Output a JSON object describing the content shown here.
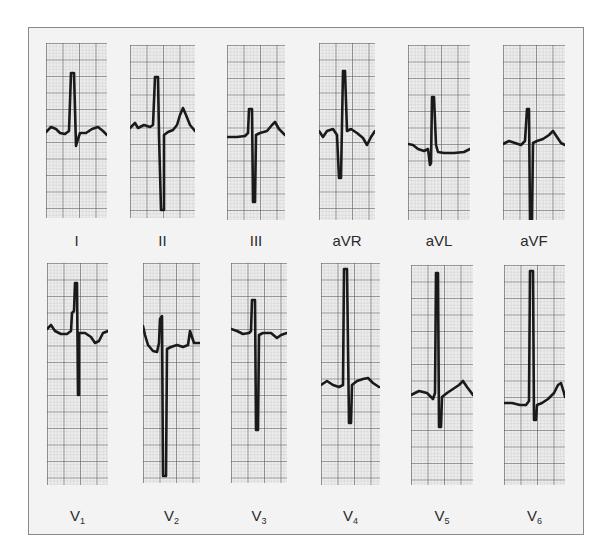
{
  "figure": {
    "type": "12-lead ECG",
    "rows": [
      {
        "name": "limb-leads",
        "leads": [
          {
            "id": "I",
            "label": "I",
            "sub": "",
            "box": [
              46,
              43,
              61,
              175
            ],
            "trace": "0,89 5,84 10,86 14,90 19,91 23,88 25,30 28,30 30,103 32,96 34,90 40,90 46,86 52,84 57,88 61,92"
          },
          {
            "id": "II",
            "label": "II",
            "sub": "",
            "box": [
              130,
              45,
              65,
              173
            ],
            "trace": "0,83 5,78 8,83 14,80 20,82 23,80 25,32 28,32 29,90 31,165 34,165 34,90 38,87 43,85 47,80 50,70 53,63 56,70 60,80 65,86"
          },
          {
            "id": "III",
            "label": "III",
            "sub": "",
            "box": [
              227,
              45,
              58,
              175
            ],
            "trace": "0,92 10,92 18,91 21,88 22,64 25,64 26,157 28,157 29,90 33,88 40,86 45,80 48,77 52,84 58,90"
          },
          {
            "id": "aVR",
            "label": "aVR",
            "sub": "",
            "box": [
              319,
              43,
              56,
              177
            ],
            "trace": "0,88 4,94 8,88 14,86 18,92 20,135 22,135 24,28 26,28 28,88 32,86 38,90 44,95 48,102 52,94 56,88"
          },
          {
            "id": "aVL",
            "label": "aVL",
            "sub": "",
            "box": [
              408,
              45,
              62,
              175
            ],
            "trace": "0,99 5,100 10,104 16,106 20,104 22,120 23,118 24,52 26,52 28,100 30,107 36,108 46,108 56,107 62,104"
          },
          {
            "id": "aVF",
            "label": "aVF",
            "sub": "",
            "box": [
              503,
              45,
              62,
              175
            ],
            "trace": "0,99 6,96 12,98 18,100 22,96 24,64 26,64 27,175 29,175 30,98 34,96 40,94 46,90 50,86 54,92 58,98 62,100"
          }
        ]
      },
      {
        "name": "precordial-leads",
        "leads": [
          {
            "id": "V1",
            "label": "V",
            "sub": "1",
            "box": [
              47,
              263,
              61,
              222
            ],
            "trace": "0,66 4,62 8,68 14,71 20,71 24,68 25,50 27,48 28,20 30,20 31,132 32,132 32,70 38,70 44,74 48,80 52,78 56,70 61,68"
          },
          {
            "id": "V2",
            "label": "V",
            "sub": "2",
            "box": [
              143,
              263,
              57,
              220
            ],
            "trace": "0,63 2,72 5,82 10,88 14,89 16,80 17,56 19,53 20,213 23,213 24,86 28,84 34,82 40,84 45,82 47,68 49,74 51,80 57,80"
          },
          {
            "id": "V3",
            "label": "V",
            "sub": "3",
            "box": [
              231,
              263,
              56,
              220
            ],
            "trace": "0,66 6,68 12,71 18,70 20,68 21,37 24,37 25,167 27,167 28,72 32,70 40,70 46,75 50,72 56,70"
          },
          {
            "id": "V4",
            "label": "V",
            "sub": "4",
            "box": [
              321,
              263,
              59,
              222
            ],
            "trace": "0,122 6,118 12,122 18,124 22,122 23,6 26,6 28,160 30,160 31,122 36,118 42,116 47,115 52,120 58,124"
          },
          {
            "id": "V5",
            "label": "V",
            "sub": "5",
            "box": [
              411,
              265,
              62,
              220
            ],
            "trace": "0,130 8,126 16,128 22,134 24,128 25,8 27,8 28,162 30,162 31,132 36,128 42,124 48,120 52,116 56,122 62,130"
          },
          {
            "id": "V6",
            "label": "V",
            "sub": "6",
            "box": [
              504,
              265,
              61,
              220
            ],
            "trace": "0,138 8,138 16,140 22,140 25,136 26,6 29,6 30,155 32,155 33,140 38,138 44,134 50,128 54,120 57,118 60,128 61,132"
          }
        ]
      }
    ],
    "colors": {
      "background": "#ffffff",
      "panel": "#f3f3f3",
      "border": "#8a8a8a",
      "paper": "#eeeeee",
      "grid_minor": "#b8b8b8",
      "grid_major": "#555555",
      "trace": "#1a1a1a",
      "label": "#2a2a2a"
    }
  }
}
